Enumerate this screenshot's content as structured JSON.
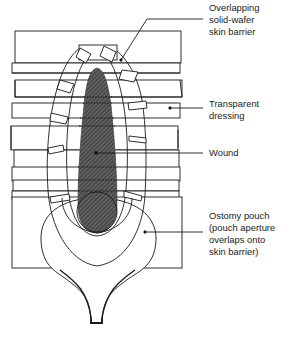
{
  "labels": {
    "skin_barrier": "Overlapping\nsolid-wafer\nskin barrier",
    "dressing": "Transparent\ndressing",
    "wound": "Wound",
    "pouch": "Ostomy pouch\n(pouch aperture\noverlaps onto\nskin barrier)"
  },
  "colors": {
    "line": "#1a1a1a",
    "wound_fill": "#555555",
    "background": "#ffffff",
    "text": "#222222"
  }
}
